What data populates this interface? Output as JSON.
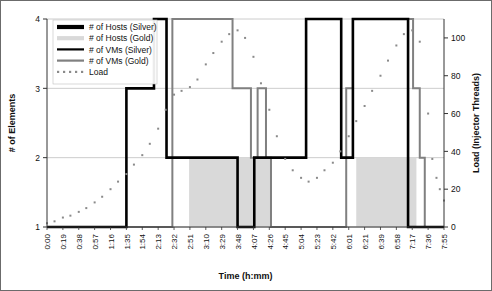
{
  "chart_data": {
    "type": "line",
    "title": "",
    "xlabel": "Time (h:mm)",
    "ylabel": "# of Elements",
    "y2label": "Load (Injector Threads)",
    "ylim": [
      1,
      4
    ],
    "yticks": [
      1,
      2,
      3,
      4
    ],
    "y2lim": [
      0,
      110
    ],
    "y2ticks": [
      0,
      20,
      40,
      60,
      80,
      100
    ],
    "grid": true,
    "legend_position": "top-left",
    "categories": [
      "0:00",
      "0:19",
      "0:38",
      "0:57",
      "1:16",
      "1:35",
      "1:54",
      "2:13",
      "2:32",
      "2:51",
      "3:10",
      "3:29",
      "3:48",
      "4:07",
      "4:26",
      "4:45",
      "5:04",
      "5:23",
      "5:42",
      "6:01",
      "6:21",
      "6:39",
      "6:58",
      "7:17",
      "7:36",
      "7:55"
    ],
    "x_minutes_min": 0,
    "x_minutes_max": 475,
    "series": [
      {
        "name": "# of Hosts (Silver)",
        "style": "step-thick-black",
        "color": "#000000",
        "axis": "left",
        "steps": [
          [
            0,
            1
          ],
          [
            95,
            1
          ],
          [
            95,
            3
          ],
          [
            128,
            3
          ],
          [
            128,
            4
          ],
          [
            143,
            4
          ],
          [
            143,
            2
          ],
          [
            228,
            2
          ],
          [
            228,
            1
          ],
          [
            248,
            1
          ],
          [
            248,
            2
          ],
          [
            310,
            2
          ],
          [
            310,
            4
          ],
          [
            352,
            4
          ],
          [
            352,
            2
          ],
          [
            366,
            2
          ],
          [
            366,
            4
          ],
          [
            432,
            4
          ],
          [
            432,
            1
          ],
          [
            475,
            1
          ]
        ]
      },
      {
        "name": "# of Hosts (Gold)",
        "style": "area-light-gray",
        "color": "#d9d9d9",
        "axis": "left",
        "steps": [
          [
            0,
            1
          ],
          [
            170,
            1
          ],
          [
            170,
            2
          ],
          [
            268,
            2
          ],
          [
            268,
            1
          ],
          [
            370,
            1
          ],
          [
            370,
            2
          ],
          [
            442,
            2
          ],
          [
            442,
            1
          ],
          [
            475,
            1
          ]
        ]
      },
      {
        "name": "# of VMs (Silver)",
        "style": "step-thin-black",
        "color": "#000000",
        "axis": "left",
        "steps": [
          [
            0,
            1
          ],
          [
            95,
            1
          ],
          [
            95,
            3
          ],
          [
            128,
            3
          ],
          [
            128,
            4
          ],
          [
            143,
            4
          ],
          [
            143,
            2
          ],
          [
            228,
            2
          ],
          [
            228,
            1
          ],
          [
            248,
            1
          ],
          [
            248,
            2
          ],
          [
            310,
            2
          ],
          [
            310,
            4
          ],
          [
            352,
            4
          ],
          [
            352,
            2
          ],
          [
            366,
            2
          ],
          [
            366,
            4
          ],
          [
            432,
            4
          ],
          [
            432,
            1
          ],
          [
            475,
            1
          ]
        ]
      },
      {
        "name": "# of VMs (Gold)",
        "style": "step-thin-gray",
        "color": "#808080",
        "axis": "left",
        "steps": [
          [
            0,
            1
          ],
          [
            150,
            1
          ],
          [
            150,
            4
          ],
          [
            222,
            4
          ],
          [
            222,
            3
          ],
          [
            244,
            3
          ],
          [
            244,
            2
          ],
          [
            252,
            2
          ],
          [
            252,
            3
          ],
          [
            262,
            3
          ],
          [
            262,
            2
          ],
          [
            268,
            2
          ],
          [
            268,
            1
          ],
          [
            358,
            1
          ],
          [
            358,
            3
          ],
          [
            366,
            3
          ],
          [
            366,
            4
          ],
          [
            438,
            4
          ],
          [
            438,
            3
          ],
          [
            446,
            3
          ],
          [
            446,
            2
          ],
          [
            452,
            2
          ],
          [
            452,
            1
          ],
          [
            475,
            1
          ]
        ]
      },
      {
        "name": "Load",
        "style": "dotted",
        "color": "#8a8a8a",
        "axis": "right",
        "points": [
          [
            0,
            2
          ],
          [
            9,
            3
          ],
          [
            19,
            5
          ],
          [
            28,
            6
          ],
          [
            38,
            8
          ],
          [
            47,
            10
          ],
          [
            57,
            13
          ],
          [
            66,
            16
          ],
          [
            76,
            20
          ],
          [
            85,
            24
          ],
          [
            95,
            28
          ],
          [
            104,
            33
          ],
          [
            114,
            38
          ],
          [
            123,
            44
          ],
          [
            133,
            52
          ],
          [
            142,
            62
          ],
          [
            152,
            70
          ],
          [
            161,
            72
          ],
          [
            171,
            74
          ],
          [
            180,
            78
          ],
          [
            190,
            86
          ],
          [
            199,
            92
          ],
          [
            209,
            98
          ],
          [
            218,
            102
          ],
          [
            228,
            104
          ],
          [
            237,
            100
          ],
          [
            247,
            90
          ],
          [
            256,
            76
          ],
          [
            266,
            62
          ],
          [
            275,
            48
          ],
          [
            285,
            36
          ],
          [
            294,
            30
          ],
          [
            304,
            26
          ],
          [
            313,
            24
          ],
          [
            323,
            26
          ],
          [
            332,
            30
          ],
          [
            342,
            34
          ],
          [
            351,
            40
          ],
          [
            361,
            48
          ],
          [
            370,
            56
          ],
          [
            380,
            64
          ],
          [
            389,
            72
          ],
          [
            399,
            80
          ],
          [
            408,
            88
          ],
          [
            418,
            96
          ],
          [
            427,
            102
          ],
          [
            437,
            104
          ],
          [
            446,
            98
          ],
          [
            456,
            60
          ],
          [
            461,
            36
          ],
          [
            466,
            26
          ],
          [
            470,
            20
          ],
          [
            475,
            14
          ]
        ]
      }
    ],
    "legend": [
      {
        "label": "# of Hosts (Silver)",
        "swatch": "thick-black"
      },
      {
        "label": "# of Hosts (Gold)",
        "swatch": "thick-lightgray"
      },
      {
        "label": "# of VMs (Silver)",
        "swatch": "thin-black"
      },
      {
        "label": "# of VMs (Gold)",
        "swatch": "thin-gray"
      },
      {
        "label": "Load",
        "swatch": "dotted-gray"
      }
    ]
  },
  "colors": {
    "black": "#000000",
    "gray": "#808080",
    "lightgray": "#d9d9d9",
    "dot": "#8a8a8a",
    "grid": "#bfbfbf",
    "frame": "#6b6b6b"
  }
}
